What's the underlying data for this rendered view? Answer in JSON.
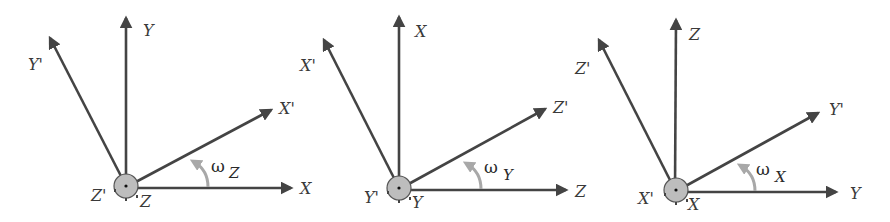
{
  "colors": {
    "axis": "#444444",
    "arc": "#a8a8a8",
    "hub_fill": "#bdbdbd",
    "hub_stroke": "#555555",
    "background": "#ffffff"
  },
  "panels": [
    {
      "id": "rotation-z",
      "rotation_axis": "Z",
      "labels": {
        "up": "Y",
        "up_prime": "Y'",
        "right_prime": "X'",
        "right": "X",
        "omega": "ω",
        "omega_sub": "Z",
        "hub_left": "Z'",
        "hub_right": "Z"
      }
    },
    {
      "id": "rotation-y",
      "rotation_axis": "Y",
      "labels": {
        "up": "X",
        "up_prime": "X'",
        "right_prime": "Z'",
        "right": "Z",
        "omega": "ω",
        "omega_sub": "Y",
        "hub_left": "Y'",
        "hub_right": "Y"
      }
    },
    {
      "id": "rotation-x",
      "rotation_axis": "X",
      "labels": {
        "up": "Z",
        "up_prime": "Z'",
        "right_prime": "Y'",
        "right": "Y",
        "omega": "ω",
        "omega_sub": "X",
        "hub_left": "X'",
        "hub_right": "X"
      }
    }
  ]
}
